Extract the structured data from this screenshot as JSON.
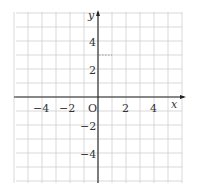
{
  "diagram": {
    "type": "coordinate-plane",
    "x_axis_label": "x",
    "y_axis_label": "y",
    "origin_label": "O",
    "x_range": [
      -6,
      6
    ],
    "y_range": [
      -6,
      6
    ],
    "grid_step": 1,
    "x_tick_labels": [
      "−4",
      "−2",
      "2",
      "4"
    ],
    "x_tick_values": [
      -4,
      -2,
      2,
      4
    ],
    "y_tick_labels": [
      "4",
      "2",
      "−2",
      "−4"
    ],
    "y_tick_values": [
      4,
      2,
      -2,
      -4
    ],
    "dotted_segment": {
      "from": [
        0,
        3
      ],
      "to": [
        1,
        3
      ]
    },
    "colors": {
      "grid": "#c8c8c8",
      "axis": "#222222",
      "dotted": "#888888",
      "text": "#333333"
    }
  }
}
